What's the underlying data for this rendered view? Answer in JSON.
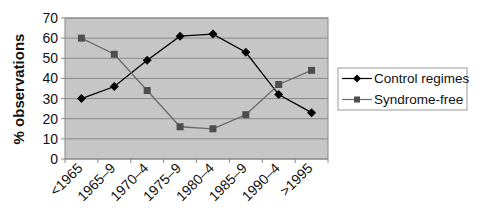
{
  "chart_data": {
    "type": "line",
    "title": "",
    "xlabel": "",
    "ylabel": "% observations",
    "ylim": [
      0,
      70
    ],
    "yticks": [
      0,
      10,
      20,
      30,
      40,
      50,
      60,
      70
    ],
    "grid": true,
    "legend_position": "right",
    "categories": [
      "<1965",
      "1965–9",
      "1970–4",
      "1975–9",
      "1980–4",
      "1985–9",
      "1990–4",
      ">1995"
    ],
    "series": [
      {
        "name": "Control regimes",
        "marker": "diamond",
        "color": "#000000",
        "values": [
          30,
          36,
          49,
          61,
          62,
          53,
          32,
          23
        ]
      },
      {
        "name": "Syndrome-free",
        "marker": "square",
        "color": "#555555",
        "values": [
          60,
          52,
          34,
          16,
          15,
          22,
          37,
          44
        ]
      }
    ]
  },
  "colors": {
    "plot_background": "#c6c6c6",
    "gridline": "#8a8a8a",
    "axis": "#888888",
    "control_line": "#000000",
    "syndrome_line": "#6a6a6a",
    "syndrome_marker": "#4e4e4e"
  }
}
